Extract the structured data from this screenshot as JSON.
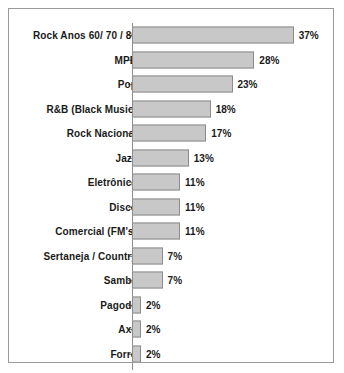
{
  "chart_data": {
    "type": "bar",
    "orientation": "horizontal",
    "title": "",
    "xlabel": "",
    "ylabel": "",
    "xlim": [
      0,
      37
    ],
    "grid": false,
    "legend": null,
    "value_suffix": "%",
    "categories": [
      "Rock Anos 60/ 70 / 80",
      "MPB",
      "Pop",
      "R&B (Black Music)",
      "Rock Nacional",
      "Jazz",
      "Eletrônica",
      "Disco",
      "Comercial (FM's)",
      "Sertaneja / Country",
      "Samba",
      "Pagode",
      "Axé",
      "Forró"
    ],
    "values": [
      37,
      28,
      23,
      18,
      17,
      13,
      11,
      11,
      11,
      7,
      7,
      2,
      2,
      2
    ],
    "value_labels": [
      "37%",
      "28%",
      "23%",
      "18%",
      "17%",
      "13%",
      "11%",
      "11%",
      "11%",
      "7%",
      "7%",
      "2%",
      "2%",
      "2%"
    ]
  },
  "style": {
    "bar_fill": "#c8c8c8",
    "bar_border": "#8c8c8c",
    "frame_border": "#9a9a9a",
    "text_color": "#1a1a1a",
    "background": "#ffffff"
  }
}
